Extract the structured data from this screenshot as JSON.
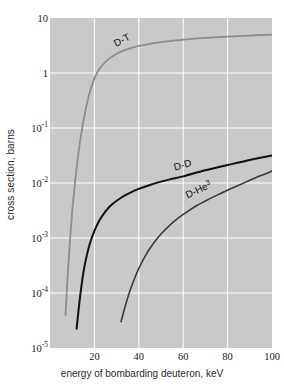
{
  "chart_data": {
    "type": "line",
    "title": "",
    "subtitle": "",
    "xlabel": "energy of bombarding deuteron, keV",
    "ylabel": "cross section, barns",
    "xscale": "linear",
    "yscale": "log",
    "xlim": [
      0,
      100
    ],
    "ylim": [
      1e-05,
      10
    ],
    "grid": true,
    "grid_color": "#ffffff",
    "plot_background": "#c9c9c9",
    "legend_position": "inline-curve-labels",
    "xticks": [
      {
        "value": 20,
        "label": "20"
      },
      {
        "value": 40,
        "label": "40"
      },
      {
        "value": 60,
        "label": "60"
      },
      {
        "value": 80,
        "label": "80"
      },
      {
        "value": 100,
        "label": "100"
      }
    ],
    "yticks": [
      {
        "value": 10,
        "mantissa": "10",
        "exponent": ""
      },
      {
        "value": 1,
        "mantissa": "1",
        "exponent": ""
      },
      {
        "value": 0.1,
        "mantissa": "10",
        "exponent": "-1"
      },
      {
        "value": 0.01,
        "mantissa": "10",
        "exponent": "-2"
      },
      {
        "value": 0.001,
        "mantissa": "10",
        "exponent": "-3"
      },
      {
        "value": 0.0001,
        "mantissa": "10",
        "exponent": "-4"
      },
      {
        "value": 1e-05,
        "mantissa": "10",
        "exponent": "-5"
      }
    ],
    "series": [
      {
        "name": "D-T",
        "label_text": "D-T",
        "label_sup": "",
        "color": "#8c8c8c",
        "width": 1.8,
        "points": [
          [
            7,
            4e-05
          ],
          [
            8,
            0.00022
          ],
          [
            9,
            0.0009
          ],
          [
            10,
            0.003
          ],
          [
            11,
            0.008
          ],
          [
            12,
            0.019
          ],
          [
            13,
            0.04
          ],
          [
            14,
            0.075
          ],
          [
            15,
            0.13
          ],
          [
            16,
            0.21
          ],
          [
            17,
            0.32
          ],
          [
            18,
            0.46
          ],
          [
            20,
            0.8
          ],
          [
            22,
            1.15
          ],
          [
            25,
            1.6
          ],
          [
            28,
            2.0
          ],
          [
            32,
            2.45
          ],
          [
            36,
            2.8
          ],
          [
            40,
            3.1
          ],
          [
            45,
            3.4
          ],
          [
            50,
            3.65
          ],
          [
            55,
            3.85
          ],
          [
            60,
            4.05
          ],
          [
            70,
            4.35
          ],
          [
            80,
            4.6
          ],
          [
            90,
            4.8
          ],
          [
            100,
            5.0
          ]
        ]
      },
      {
        "name": "D-D",
        "label_text": "D-D",
        "label_sup": "",
        "color": "#111111",
        "width": 2.0,
        "points": [
          [
            12,
            2.25e-05
          ],
          [
            13,
            5.5e-05
          ],
          [
            14,
            0.00012
          ],
          [
            15,
            0.00023
          ],
          [
            16,
            0.00038
          ],
          [
            18,
            0.0008
          ],
          [
            20,
            0.00135
          ],
          [
            22,
            0.002
          ],
          [
            25,
            0.00305
          ],
          [
            28,
            0.0041
          ],
          [
            32,
            0.0054
          ],
          [
            36,
            0.0066
          ],
          [
            40,
            0.0078
          ],
          [
            45,
            0.0092
          ],
          [
            50,
            0.0106
          ],
          [
            55,
            0.0119
          ],
          [
            60,
            0.0132
          ],
          [
            70,
            0.017
          ],
          [
            80,
            0.0212
          ],
          [
            90,
            0.0262
          ],
          [
            100,
            0.0315
          ]
        ]
      },
      {
        "name": "D-He3",
        "label_text": "D-He",
        "label_sup": "3",
        "color": "#3a3a3a",
        "width": 1.6,
        "points": [
          [
            32,
            3e-05
          ],
          [
            34,
            6e-05
          ],
          [
            36,
            0.00011
          ],
          [
            38,
            0.00018
          ],
          [
            40,
            0.00028
          ],
          [
            43,
            0.00048
          ],
          [
            46,
            0.00074
          ],
          [
            50,
            0.00118
          ],
          [
            54,
            0.00172
          ],
          [
            58,
            0.00235
          ],
          [
            62,
            0.00305
          ],
          [
            66,
            0.00385
          ],
          [
            70,
            0.0047
          ],
          [
            75,
            0.00595
          ],
          [
            80,
            0.0074
          ],
          [
            85,
            0.0091
          ],
          [
            90,
            0.0112
          ],
          [
            95,
            0.0137
          ],
          [
            100,
            0.0165
          ]
        ]
      }
    ]
  }
}
